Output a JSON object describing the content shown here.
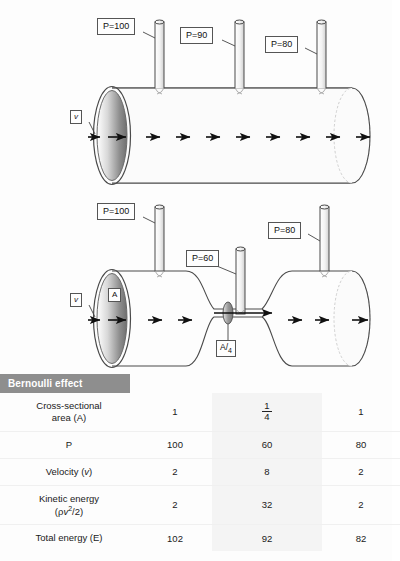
{
  "figure": {
    "title": "Bernoulli effect",
    "top_pipe": {
      "name": "uniform-pipe",
      "velocity_label": "v",
      "pressure_labels": [
        "P=100",
        "P=90",
        "P=80"
      ],
      "arrow_count": 10
    },
    "bottom_pipe": {
      "name": "constricted-pipe",
      "velocity_label": "v",
      "area_label": "A",
      "constriction_label_numerator": "A",
      "constriction_label_denominator": "4",
      "pressure_labels": [
        "P=100",
        "P=60",
        "P=80"
      ],
      "arrow_count": 9
    }
  },
  "table": {
    "header": "Bernoulli effect",
    "rows": [
      {
        "label_line1": "Cross-sectional",
        "label_line2": "area (A)",
        "values": [
          "1",
          "1/4",
          "1"
        ],
        "middle_is_fraction": true,
        "frac_num": "1",
        "frac_den": "4"
      },
      {
        "label_line1": "P",
        "label_line2": "",
        "values": [
          "100",
          "60",
          "80"
        ],
        "middle_is_fraction": false
      },
      {
        "label_line1": "Velocity (v)",
        "label_line2": "",
        "values": [
          "2",
          "8",
          "2"
        ],
        "middle_is_fraction": false
      },
      {
        "label_line1": "Kinetic energy",
        "label_line2": "(ρv2/2)",
        "values": [
          "2",
          "32",
          "2"
        ],
        "middle_is_fraction": false
      },
      {
        "label_line1": "Total energy (E)",
        "label_line2": "",
        "values": [
          "102",
          "92",
          "82"
        ],
        "middle_is_fraction": false
      }
    ]
  },
  "colors": {
    "header_bg": "#8e8e8e",
    "header_text": "#ffffff",
    "line": "#444444",
    "middle_column_bg": "#f4f4f4"
  }
}
